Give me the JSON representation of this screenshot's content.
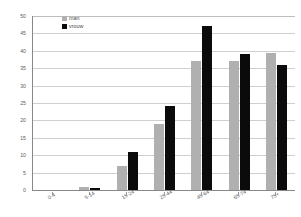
{
  "chart_data": {
    "type": "bar",
    "title": "",
    "xlabel": "",
    "ylabel": "",
    "ylim": [
      0,
      50
    ],
    "ytick_step": 5,
    "grid": true,
    "legend_position": "top-left",
    "categories": [
      "0-4",
      "5-14",
      "15-24",
      "25-44",
      "45-64",
      "65-74",
      "75+"
    ],
    "series": [
      {
        "name": "man",
        "color": "#b0b0b0",
        "values": [
          0,
          1,
          7,
          19,
          37,
          37,
          39.5
        ]
      },
      {
        "name": "vrouw",
        "color": "#0b0b0b",
        "values": [
          0,
          0.5,
          11,
          24,
          47,
          39,
          36
        ]
      }
    ],
    "ytick_labels": [
      "50",
      "45",
      "40",
      "35",
      "30",
      "25",
      "20",
      "15",
      "10",
      "5",
      "0"
    ],
    "ytick_values": [
      50,
      45,
      40,
      35,
      30,
      25,
      20,
      15,
      10,
      5,
      0
    ]
  },
  "legend": {
    "items": [
      {
        "label": "man"
      },
      {
        "label": "vrouw"
      }
    ]
  }
}
